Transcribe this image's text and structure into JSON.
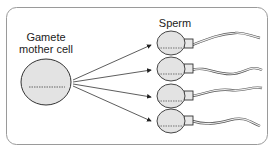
{
  "diagram": {
    "mother_label_line1": "Gamete",
    "mother_label_line2": "mother cell",
    "sperm_label": "Sperm",
    "sperm_count": 4,
    "colors": {
      "frame": "#9a9a9a",
      "cell_fill": "#e3e3e3",
      "outline": "#333333"
    }
  }
}
